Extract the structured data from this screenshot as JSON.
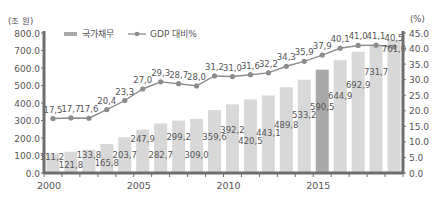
{
  "chart_data": {
    "type": "bar+line",
    "title": "",
    "categories": [
      "2000",
      "2001",
      "2002",
      "2003",
      "2004",
      "2005",
      "2006",
      "2007",
      "2008",
      "2009",
      "2010",
      "2011",
      "2012",
      "2013",
      "2014",
      "2015",
      "2016",
      "2017",
      "2018"
    ],
    "x_tick_labels": [
      "2000",
      "2005",
      "2010",
      "2015"
    ],
    "left_axis": {
      "unit_label": "(조 원)",
      "ylim": [
        0,
        800
      ],
      "ticks": [
        "0.0",
        "100.0",
        "200.0",
        "300.0",
        "400.0",
        "500.0",
        "600.0",
        "700.0",
        "800.0"
      ]
    },
    "right_axis": {
      "unit_label": "(%)",
      "ylim": [
        0,
        45
      ],
      "ticks": [
        "0.0",
        "5.0",
        "10.0",
        "15.0",
        "20.0",
        "25.0",
        "30.0",
        "35.0",
        "40.0",
        "45.0"
      ]
    },
    "series": [
      {
        "name": "국가채무",
        "type": "bar",
        "axis": "left",
        "values": [
          111.2,
          121.8,
          133.8,
          165.8,
          203.7,
          247.9,
          282.7,
          299.2,
          309.0,
          359.6,
          392.2,
          420.5,
          443.1,
          489.8,
          533.2,
          590.5,
          644.9,
          692.9,
          731.7
        ],
        "labels": [
          "111,2",
          "121,8",
          "133,8",
          "165,8",
          "203,7",
          "247,9",
          "282,7",
          "299,2",
          "309,0",
          "359,6",
          "392,2",
          "420,5",
          "443,1",
          "489,8",
          "533,2",
          "590,5",
          "644,9",
          "692,9",
          "731,7"
        ],
        "highlight_index": 15
      },
      {
        "name": "GDP 대비%",
        "type": "line",
        "axis": "right",
        "values": [
          17.5,
          17.7,
          17.6,
          20.4,
          23.3,
          27.0,
          29.3,
          28.7,
          28.0,
          31.2,
          31.0,
          31.6,
          32.2,
          34.3,
          35.9,
          37.9,
          40.1,
          41.0,
          41.1
        ],
        "labels": [
          "17,5",
          "17,7",
          "17,6",
          "20,4",
          "23,3",
          "27,0",
          "29,3",
          "28,7",
          "28,0",
          "31,2",
          "31,0",
          "31,6",
          "32,2",
          "34,3",
          "35,9",
          "37,9",
          "40,1",
          "41,0",
          "41,1"
        ]
      }
    ],
    "extra_point": {
      "category": "2019",
      "bar_value": 761.0,
      "bar_label": "761,0",
      "line_value": 40.5,
      "line_label": "40,5"
    },
    "legend": {
      "position": "top-left",
      "entries": [
        "국가채무",
        "GDP 대비%"
      ]
    },
    "colors": {
      "bar": "#d8d8d8",
      "bar_highlight": "#a9a9a9",
      "line": "#8c8c8c",
      "axis": "#6e6e6e",
      "text": "#555555"
    }
  }
}
